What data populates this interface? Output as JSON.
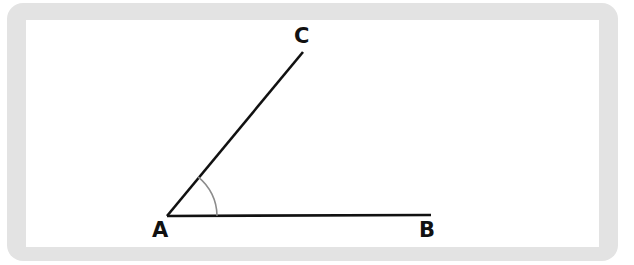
{
  "figure": {
    "background_color": "#ffffff",
    "frame_color": "#e3e3e3",
    "line_color": "#111111",
    "arc_color": "#8c8c8c",
    "label_color": "#111111"
  },
  "labels": {
    "vertex": "A",
    "ray_horizontal_end": "B",
    "ray_diagonal_end": "C"
  },
  "geometry": {
    "points": {
      "A": {
        "x": 167,
        "y": 216
      },
      "B": {
        "x": 431,
        "y": 215
      },
      "C": {
        "x": 303,
        "y": 52
      }
    },
    "segments": [
      {
        "name": "segment-AB",
        "from": "A",
        "to": "B",
        "stroke_width": 2.6
      },
      {
        "name": "segment-AC",
        "from": "A",
        "to": "C",
        "stroke_width": 2.6
      }
    ],
    "angle_arc": {
      "name": "angle-arc-BAC",
      "center": "A",
      "radius": 50,
      "start_angle_deg": 51.7,
      "end_angle_deg": 0.2,
      "stroke_width": 1.6
    }
  }
}
